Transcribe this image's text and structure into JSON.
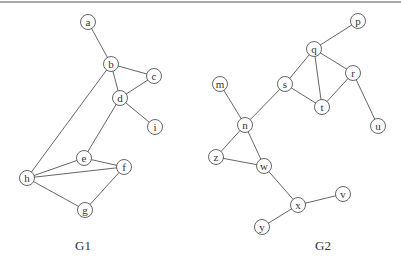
{
  "graphs": [
    {
      "id": "G1",
      "label": "G1",
      "nodes": [
        "a",
        "b",
        "c",
        "d",
        "i",
        "e",
        "f",
        "h",
        "g"
      ],
      "edges": [
        [
          "a",
          "b"
        ],
        [
          "b",
          "c"
        ],
        [
          "b",
          "d"
        ],
        [
          "c",
          "d"
        ],
        [
          "d",
          "i"
        ],
        [
          "b",
          "h"
        ],
        [
          "d",
          "e"
        ],
        [
          "e",
          "h"
        ],
        [
          "e",
          "f"
        ],
        [
          "h",
          "f"
        ],
        [
          "h",
          "g"
        ],
        [
          "g",
          "f"
        ]
      ]
    },
    {
      "id": "G2",
      "label": "G2",
      "nodes": [
        "p",
        "q",
        "r",
        "s",
        "t",
        "u",
        "m",
        "n",
        "z",
        "w",
        "x",
        "v",
        "y"
      ],
      "edges": [
        [
          "p",
          "q"
        ],
        [
          "q",
          "s"
        ],
        [
          "q",
          "t"
        ],
        [
          "q",
          "r"
        ],
        [
          "s",
          "t"
        ],
        [
          "r",
          "t"
        ],
        [
          "r",
          "u"
        ],
        [
          "m",
          "n"
        ],
        [
          "s",
          "n"
        ],
        [
          "n",
          "z"
        ],
        [
          "n",
          "w"
        ],
        [
          "z",
          "w"
        ],
        [
          "w",
          "x"
        ],
        [
          "x",
          "v"
        ],
        [
          "x",
          "y"
        ]
      ]
    }
  ]
}
